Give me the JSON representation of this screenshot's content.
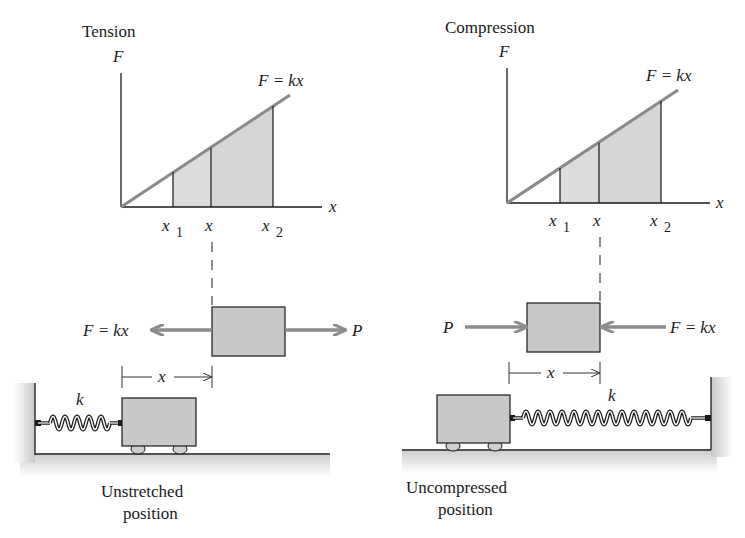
{
  "left_panel": {
    "title": "Tension",
    "y_axis_label": "F",
    "x_axis_label": "x",
    "line_label": "F = kx",
    "ticks": [
      {
        "base": "x",
        "sub": "1"
      },
      {
        "base": "x",
        "sub": ""
      },
      {
        "base": "x",
        "sub": "2"
      }
    ],
    "force_left_label": "F = kx",
    "force_right_label": "P",
    "dimension_label": "x",
    "spring_label": "k",
    "caption_line1": "Unstretched",
    "caption_line2": "position"
  },
  "right_panel": {
    "title": "Compression",
    "y_axis_label": "F",
    "x_axis_label": "x",
    "line_label": "F = kx",
    "ticks": [
      {
        "base": "x",
        "sub": "1"
      },
      {
        "base": "x",
        "sub": ""
      },
      {
        "base": "x",
        "sub": "2"
      }
    ],
    "force_left_label": "P",
    "force_right_label": "F = kx",
    "dimension_label": "x",
    "spring_label": "k",
    "caption_line1": "Uncompressed",
    "caption_line2": "position"
  },
  "colors": {
    "line": "#8a8a8a",
    "shade": "#d9d9d9",
    "block": "#c8c8c8",
    "ink": "#1a1a1a",
    "arrow": "#8c8c8c"
  }
}
